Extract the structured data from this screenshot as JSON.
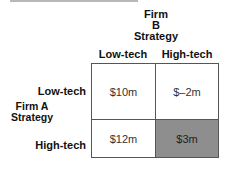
{
  "diagram": {
    "type": "payoff-matrix",
    "column_player": {
      "lines": [
        "Firm",
        "B",
        "Strategy"
      ]
    },
    "row_player": {
      "lines": [
        "Firm A",
        "Strategy"
      ]
    },
    "columns": [
      "Low-tech",
      "High-tech"
    ],
    "rows": [
      "Low-tech",
      "High-tech"
    ],
    "cells": [
      [
        "$10m",
        "$–2m"
      ],
      [
        "$12m",
        "$3m"
      ]
    ],
    "highlighted_cell": {
      "row": 1,
      "col": 1,
      "color": "#8e8e8e"
    }
  }
}
